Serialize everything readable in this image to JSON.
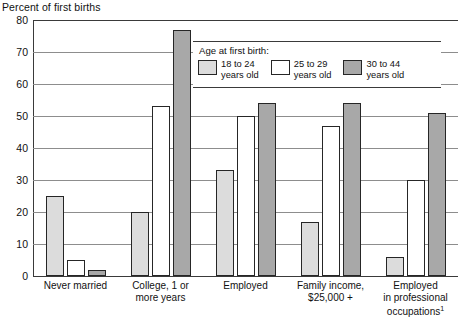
{
  "chart_data": {
    "type": "bar",
    "title": "Percent of first births",
    "xlabel": "",
    "ylabel": "Percent of first births",
    "ylim": [
      0,
      80
    ],
    "yticks": [
      0,
      10,
      20,
      30,
      40,
      50,
      60,
      70,
      80
    ],
    "grid": true,
    "legend_position": "inside-top-right",
    "legend_title": "Age at first birth:",
    "categories": [
      "Never married",
      "College, 1 or more years",
      "Employed",
      "Family income, $25,000 +",
      "Employed in professional occupations"
    ],
    "category_lines": [
      [
        "Never married"
      ],
      [
        "College, 1 or",
        "more years"
      ],
      [
        "Employed"
      ],
      [
        "Family income,",
        "$25,000 +"
      ],
      [
        "Employed",
        "in professional",
        "occupations"
      ]
    ],
    "footnote_marker": "1",
    "series": [
      {
        "name": "18 to 24 years old",
        "color": "#dcdcdc",
        "values": [
          25,
          20,
          33,
          17,
          6
        ]
      },
      {
        "name": "25 to 29 years old",
        "color": "#ffffff",
        "values": [
          5,
          53,
          50,
          47,
          30
        ]
      },
      {
        "name": "30 to 44 years old",
        "color": "#a8a8a8",
        "values": [
          2,
          77,
          54,
          54,
          51
        ]
      }
    ],
    "legend_entries": [
      {
        "label_line1": "18 to 24",
        "label_line2": "years old",
        "swatch": "s0"
      },
      {
        "label_line1": "25 to 29",
        "label_line2": "years old",
        "swatch": "s1"
      },
      {
        "label_line1": "30 to 44",
        "label_line2": "years old",
        "swatch": "s2"
      }
    ]
  }
}
